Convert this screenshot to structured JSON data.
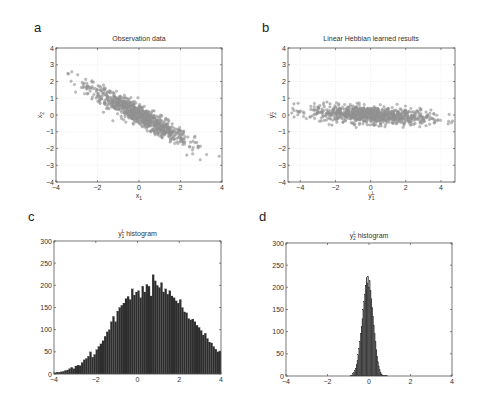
{
  "figure": {
    "width": 477,
    "height": 406,
    "colors": {
      "scatter": "#8a8a8a",
      "scatter_edge": "#9a9a9a",
      "bar": "#2e2e2e",
      "axis": "#555555",
      "grid": "#e4e4e4"
    }
  },
  "chart_data": [
    {
      "id": "a",
      "type": "scatter",
      "panel_letter": "a",
      "title": "Observation data",
      "xlabel": "x1",
      "xlabel_main": "x",
      "xlabel_sub": "1",
      "ylabel": "x2",
      "ylabel_main": "x",
      "ylabel_sub": "2",
      "xlim": [
        -4,
        4
      ],
      "ylim": [
        -4,
        4
      ],
      "xticks": [
        -4,
        -2,
        0,
        2,
        4
      ],
      "yticks": [
        -4,
        -3,
        -2,
        -1,
        0,
        1,
        2,
        3,
        4
      ],
      "grid": true,
      "box": {
        "x0": 56,
        "y0": 48,
        "x1": 222,
        "y1": 182
      },
      "distribution": {
        "description": "elongated cloud along line x2 ≈ -0.7·x1",
        "major_axis_slope": -0.7,
        "major_std": 1.45,
        "minor_std": 0.25,
        "n_points": 900,
        "x_extent": [
          -3.8,
          4.0
        ],
        "y_extent": [
          -2.7,
          2.5
        ]
      }
    },
    {
      "id": "b",
      "type": "scatter",
      "panel_letter": "b",
      "title": "Linear Hebbian learned results",
      "xlabel": "y1^L",
      "xlabel_main": "y",
      "xlabel_sub": "1",
      "xlabel_sup": "L",
      "ylabel": "y2^L",
      "ylabel_main": "y",
      "ylabel_sub": "2",
      "ylabel_sup": "L",
      "xlim": [
        -4.7,
        4.8
      ],
      "ylim": [
        -4,
        4
      ],
      "xticks": [
        -4,
        -2,
        0,
        2,
        4
      ],
      "yticks": [
        -4,
        -3,
        -2,
        -1,
        0,
        1,
        2,
        3,
        4
      ],
      "grid": true,
      "box": {
        "x0": 288,
        "y0": 48,
        "x1": 455,
        "y1": 182
      },
      "distribution": {
        "description": "horizontal cloud, slight negative tilt",
        "major_axis_slope": -0.06,
        "major_std": 1.7,
        "minor_std": 0.25,
        "n_points": 900,
        "x_extent": [
          -4.5,
          4.7
        ],
        "y_extent": [
          -0.8,
          0.8
        ]
      }
    },
    {
      "id": "c",
      "type": "bar",
      "panel_letter": "c",
      "title": "y1^L histogram",
      "title_main": "y",
      "title_sub": "1",
      "title_sup": "L",
      "title_rest": " histogram",
      "xlabel": "",
      "ylabel": "",
      "xlim": [
        -4,
        4
      ],
      "ylim": [
        0,
        300
      ],
      "xticks": [
        -4,
        -2,
        0,
        2,
        4
      ],
      "yticks": [
        0,
        50,
        100,
        150,
        200,
        250,
        300
      ],
      "grid": false,
      "box": {
        "x0": 54,
        "y0": 241,
        "x1": 221,
        "y1": 374
      },
      "bin_start": -4.0,
      "bin_width": 0.1,
      "values": [
        3,
        4,
        4,
        5,
        6,
        8,
        9,
        12,
        15,
        12,
        18,
        20,
        19,
        26,
        32,
        35,
        40,
        50,
        38,
        44,
        55,
        62,
        68,
        75,
        85,
        95,
        100,
        118,
        130,
        118,
        142,
        150,
        155,
        160,
        170,
        175,
        168,
        192,
        178,
        185,
        188,
        172,
        198,
        185,
        202,
        198,
        176,
        224,
        210,
        200,
        195,
        206,
        185,
        192,
        180,
        188,
        176,
        172,
        165,
        160,
        168,
        150,
        140,
        138,
        125,
        122,
        124,
        118,
        110,
        105,
        98,
        88,
        92,
        80,
        72,
        70,
        62,
        56,
        50,
        52,
        48,
        40,
        36,
        34,
        28,
        24,
        22,
        18,
        14,
        12,
        10,
        8,
        6,
        4,
        3,
        2
      ]
    },
    {
      "id": "d",
      "type": "bar",
      "panel_letter": "d",
      "title": "y2^L histogram",
      "title_main": "y",
      "title_sub": "2",
      "title_sup": "L",
      "title_rest": " histogram",
      "xlabel": "",
      "ylabel": "",
      "xlim": [
        -4,
        4
      ],
      "ylim": [
        0,
        300
      ],
      "xticks": [
        -4,
        -2,
        0,
        2,
        4
      ],
      "yticks": [
        0,
        50,
        100,
        150,
        200,
        250,
        300
      ],
      "grid": false,
      "box": {
        "x0": 286,
        "y0": 243,
        "x1": 452,
        "y1": 376
      },
      "bin_start": -0.9,
      "bin_width": 0.04,
      "values": [
        1,
        2,
        3,
        5,
        8,
        12,
        18,
        26,
        36,
        48,
        62,
        78,
        95,
        112,
        130,
        150,
        168,
        185,
        205,
        222,
        210,
        225,
        200,
        215,
        192,
        175,
        155,
        135,
        115,
        96,
        78,
        60,
        45,
        32,
        22,
        14,
        8,
        5,
        3,
        2,
        1,
        1,
        1,
        1,
        1
      ]
    }
  ]
}
